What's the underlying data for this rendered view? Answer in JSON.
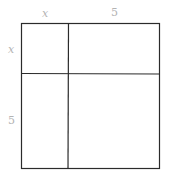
{
  "diagram": {
    "type": "area-model-square",
    "top_labels": [
      {
        "text": "x",
        "italic": true
      },
      {
        "text": "5",
        "italic": false
      }
    ],
    "left_labels": [
      {
        "text": "x",
        "italic": true
      },
      {
        "text": "5",
        "italic": false
      }
    ],
    "colors": {
      "line": "#2b2b2b",
      "label": "#b3b3b3",
      "background": "#ffffff"
    }
  }
}
